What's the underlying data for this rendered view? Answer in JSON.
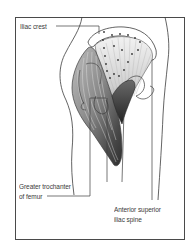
{
  "figure": {
    "type": "anatomical-illustration",
    "colors": {
      "frame": "#4a4a4a",
      "outline": "#3c3c3c",
      "muscle_dark": "#3a3a3a",
      "muscle_mid": "#8a8a8a",
      "muscle_light": "#d8d8d8",
      "background": "#ffffff"
    }
  },
  "labels": {
    "iliac_crest": "Iliac crest",
    "greater_trochanter": {
      "line1": "Greater trochanter",
      "line2": "of femur"
    },
    "asis": {
      "line1": "Anterior superior",
      "line2": "iliac spine"
    }
  }
}
